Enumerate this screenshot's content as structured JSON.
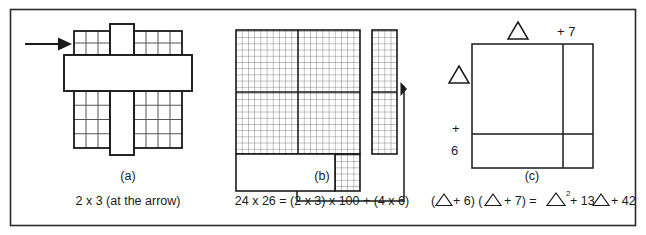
{
  "figure": {
    "border_color": "#2b2b2b",
    "background": "#ffffff",
    "ink_color": "#1a1a1a",
    "grid_line_color": "#555555",
    "panels": [
      {
        "id": "panel-a",
        "letter": "(a)",
        "caption": "2 x 3 (at the arrow)",
        "arrow_label": "arrow-pointing-right",
        "grid": {
          "left_columns": 3,
          "right_columns": 4,
          "top_rows": 2,
          "bottom_rows": 4,
          "highlight_shape": "cross"
        }
      },
      {
        "id": "panel-b",
        "letter": "(b)",
        "caption": "24 x 26 = (2 x 3) x 100 + (4 x 6)",
        "grid": {
          "main_columns": 20,
          "main_rows": 20,
          "strip_columns": 4,
          "strip_rows": 20,
          "block_columns": 4,
          "block_rows": 6,
          "major_col_split": 10,
          "major_row_split": 10
        },
        "arrow_label": "arrow-pointing-left"
      },
      {
        "id": "panel-c",
        "letter": "(c)",
        "caption_parts": {
          "open1": "(",
          "tri1": "△",
          "plus6": "+ 6) (",
          "tri2": "△",
          "plus7": "+ 7) = ",
          "tri3": "△",
          "sup2": "2",
          "mid": "+ 13",
          "tri4": "△",
          "end": "+ 42"
        },
        "caption_plain": "(△+ 6) (△ + 7) = △² + 13△ + 42",
        "labels": {
          "top_triangle": "△",
          "top_plus7": "+ 7",
          "left_triangle": "△",
          "left_plus": "+",
          "left_six": "6"
        }
      }
    ]
  }
}
